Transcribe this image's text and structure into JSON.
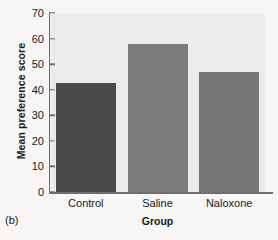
{
  "figure": {
    "panel_label": "(b)"
  },
  "chart_data": {
    "type": "bar",
    "title": "",
    "categories": [
      "Control",
      "Saline",
      "Naloxone"
    ],
    "values": [
      42.5,
      58,
      47
    ],
    "series": [
      {
        "name": "Mean preference score",
        "values": [
          42.5,
          58,
          47
        ]
      }
    ],
    "xlabel": "Group",
    "ylabel": "Mean preference score",
    "ylim": [
      0,
      70
    ],
    "yticks": [
      0,
      10,
      20,
      30,
      40,
      50,
      60,
      70
    ],
    "ytick_labels": [
      "0",
      "10",
      "20",
      "30",
      "40",
      "50",
      "60",
      "70"
    ],
    "grid": false,
    "legend": false,
    "bar_colors": [
      "#4a4a4a",
      "#7c7c7c",
      "#767676"
    ],
    "plot_background": "#ececec",
    "figure_background": "#f7f6f4",
    "axis_color": "#6f6f6f"
  }
}
